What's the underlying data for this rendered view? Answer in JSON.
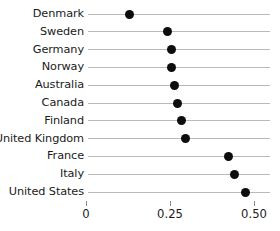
{
  "chart_data": {
    "type": "scatter",
    "subtype": "dot-plot",
    "title": "",
    "subtitle": "",
    "xlabel": "",
    "ylabel": "",
    "categories": [
      "Denmark",
      "Sweden",
      "Germany",
      "Norway",
      "Australia",
      "Canada",
      "Finland",
      "United Kingdom",
      "France",
      "Italy",
      "United States"
    ],
    "values": [
      0.128,
      0.244,
      0.253,
      0.253,
      0.262,
      0.271,
      0.283,
      0.295,
      0.423,
      0.443,
      0.476
    ],
    "xlim": [
      0,
      0.53
    ],
    "xticks": [
      0,
      0.25,
      0.5
    ],
    "xticklabels": [
      "0",
      "0.25",
      "0.50"
    ],
    "orientation": "horizontal",
    "grid": false,
    "connector_lines": true,
    "legend": null,
    "marker": {
      "shape": "circle",
      "color": "#0d0d0d",
      "size_px": 9
    },
    "line_color": "#b9b9b9",
    "background_color": "#ffffff",
    "text_color": "#1a1a1a"
  }
}
